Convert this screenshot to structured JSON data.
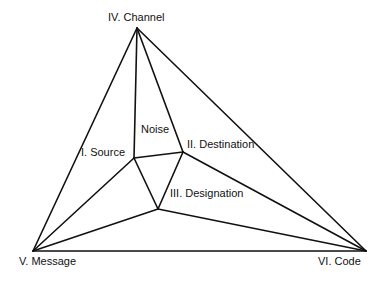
{
  "diagram": {
    "type": "communication-model-graph",
    "nodes": [
      {
        "id": "channel",
        "label": "IV. Channel",
        "x": 137,
        "y": 28,
        "label_x": 108,
        "label_y": 12
      },
      {
        "id": "source",
        "label": "I. Source",
        "x": 134,
        "y": 158,
        "label_x": 81,
        "label_y": 147
      },
      {
        "id": "destination",
        "label": "II. Destination",
        "x": 183,
        "y": 152,
        "label_x": 187,
        "label_y": 139
      },
      {
        "id": "designation",
        "label": "III. Designation",
        "x": 158,
        "y": 209,
        "label_x": 170,
        "label_y": 188
      },
      {
        "id": "message",
        "label": "V. Message",
        "x": 33,
        "y": 251,
        "label_x": 19,
        "label_y": 256
      },
      {
        "id": "code",
        "label": "VI. Code",
        "x": 366,
        "y": 251,
        "label_x": 318,
        "label_y": 256
      }
    ],
    "region_labels": [
      {
        "id": "noise",
        "label": "Noise",
        "label_x": 141,
        "label_y": 124
      }
    ],
    "edges": [
      [
        "channel",
        "message"
      ],
      [
        "channel",
        "code"
      ],
      [
        "message",
        "code"
      ],
      [
        "channel",
        "source"
      ],
      [
        "channel",
        "destination"
      ],
      [
        "source",
        "destination"
      ],
      [
        "source",
        "designation"
      ],
      [
        "destination",
        "designation"
      ],
      [
        "message",
        "source"
      ],
      [
        "message",
        "designation"
      ],
      [
        "code",
        "destination"
      ],
      [
        "code",
        "designation"
      ]
    ],
    "extra_edges": [
      {
        "from": "channel",
        "to_point": [
          137,
          28
        ],
        "note": "vertical spoke"
      }
    ],
    "line_color": "#111111",
    "background": "#ffffff"
  }
}
